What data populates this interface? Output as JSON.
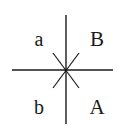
{
  "diagram": {
    "line_color": "#1a1a1a",
    "background": "#ffffff",
    "center": {
      "x": 66,
      "y": 70
    },
    "lines": {
      "vertical": {
        "x1": 66,
        "y1": 15,
        "x2": 66,
        "y2": 124
      },
      "horizontal": {
        "x1": 12,
        "y1": 70,
        "x2": 113,
        "y2": 70
      },
      "diagonal_1": {
        "x1": 53,
        "y1": 53,
        "x2": 79,
        "y2": 88
      },
      "diagonal_2": {
        "x1": 79,
        "y1": 53,
        "x2": 53,
        "y2": 88
      }
    },
    "labels": {
      "top_left": "a",
      "top_right": "B",
      "bottom_left": "b",
      "bottom_right": "A"
    }
  }
}
